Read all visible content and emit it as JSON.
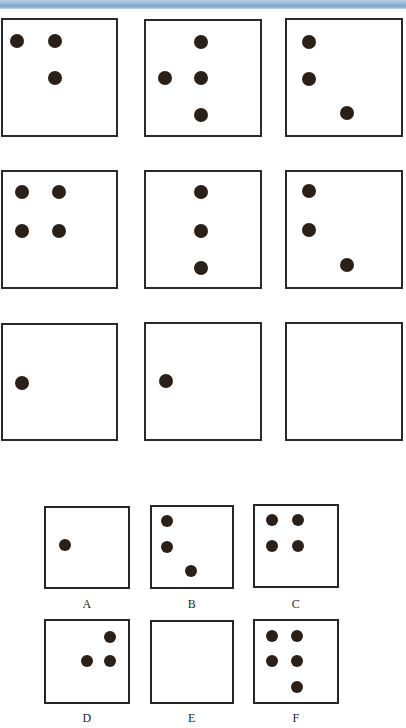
{
  "page": {
    "width": 406,
    "height": 728,
    "background_color": "#ffffff",
    "banner_color": "#7ba5cc",
    "dot_color": "#2b2018",
    "border_color": "#262626",
    "type": "matrix-reasoning-puzzle"
  },
  "matrix": {
    "rows": 3,
    "columns": 3,
    "cells": [
      {
        "id": "matrix-cell-1",
        "row": 1,
        "col": 1,
        "dot_count": 3,
        "dots": [
          {
            "x": 17,
            "y": 41
          },
          {
            "x": 55,
            "y": 41
          },
          {
            "x": 55,
            "y": 78
          }
        ]
      },
      {
        "id": "matrix-cell-2",
        "row": 1,
        "col": 2,
        "dot_count": 4,
        "dots": [
          {
            "x": 201,
            "y": 42
          },
          {
            "x": 165,
            "y": 78
          },
          {
            "x": 201,
            "y": 78
          },
          {
            "x": 201,
            "y": 115
          }
        ]
      },
      {
        "id": "matrix-cell-3",
        "row": 1,
        "col": 3,
        "dot_count": 3,
        "dots": [
          {
            "x": 309,
            "y": 42
          },
          {
            "x": 309,
            "y": 79
          },
          {
            "x": 347,
            "y": 113
          }
        ]
      },
      {
        "id": "matrix-cell-4",
        "row": 2,
        "col": 1,
        "dot_count": 4,
        "dots": [
          {
            "x": 22,
            "y": 192
          },
          {
            "x": 59,
            "y": 192
          },
          {
            "x": 22,
            "y": 231
          },
          {
            "x": 59,
            "y": 231
          }
        ]
      },
      {
        "id": "matrix-cell-5",
        "row": 2,
        "col": 2,
        "dot_count": 3,
        "dots": [
          {
            "x": 201,
            "y": 192
          },
          {
            "x": 201,
            "y": 231
          },
          {
            "x": 201,
            "y": 268
          }
        ]
      },
      {
        "id": "matrix-cell-6",
        "row": 2,
        "col": 3,
        "dot_count": 3,
        "dots": [
          {
            "x": 309,
            "y": 191
          },
          {
            "x": 309,
            "y": 230
          },
          {
            "x": 347,
            "y": 265
          }
        ]
      },
      {
        "id": "matrix-cell-7",
        "row": 3,
        "col": 1,
        "dot_count": 1,
        "dots": [
          {
            "x": 22,
            "y": 383
          }
        ]
      },
      {
        "id": "matrix-cell-8",
        "row": 3,
        "col": 2,
        "dot_count": 1,
        "dots": [
          {
            "x": 166,
            "y": 381
          }
        ]
      },
      {
        "id": "matrix-cell-9-missing",
        "row": 3,
        "col": 3,
        "dot_count": 0,
        "dots": []
      }
    ]
  },
  "options": [
    {
      "id": "option-a",
      "label": "A",
      "dot_count": 1,
      "dots": [
        {
          "x": 65,
          "y": 545
        }
      ]
    },
    {
      "id": "option-b",
      "label": "B",
      "dot_count": 3,
      "dots": [
        {
          "x": 167,
          "y": 521
        },
        {
          "x": 167,
          "y": 547
        },
        {
          "x": 191,
          "y": 571
        }
      ]
    },
    {
      "id": "option-c",
      "label": "C",
      "dot_count": 4,
      "dots": [
        {
          "x": 272,
          "y": 520
        },
        {
          "x": 298,
          "y": 520
        },
        {
          "x": 272,
          "y": 546
        },
        {
          "x": 298,
          "y": 546
        }
      ]
    },
    {
      "id": "option-d",
      "label": "D",
      "dot_count": 3,
      "dots": [
        {
          "x": 110,
          "y": 637
        },
        {
          "x": 87,
          "y": 661
        },
        {
          "x": 110,
          "y": 661
        }
      ]
    },
    {
      "id": "option-e",
      "label": "E",
      "dot_count": 0,
      "dots": []
    },
    {
      "id": "option-f",
      "label": "F",
      "dot_count": 5,
      "dots": [
        {
          "x": 272,
          "y": 636
        },
        {
          "x": 297,
          "y": 636
        },
        {
          "x": 272,
          "y": 661
        },
        {
          "x": 297,
          "y": 661
        },
        {
          "x": 297,
          "y": 687
        }
      ]
    }
  ]
}
